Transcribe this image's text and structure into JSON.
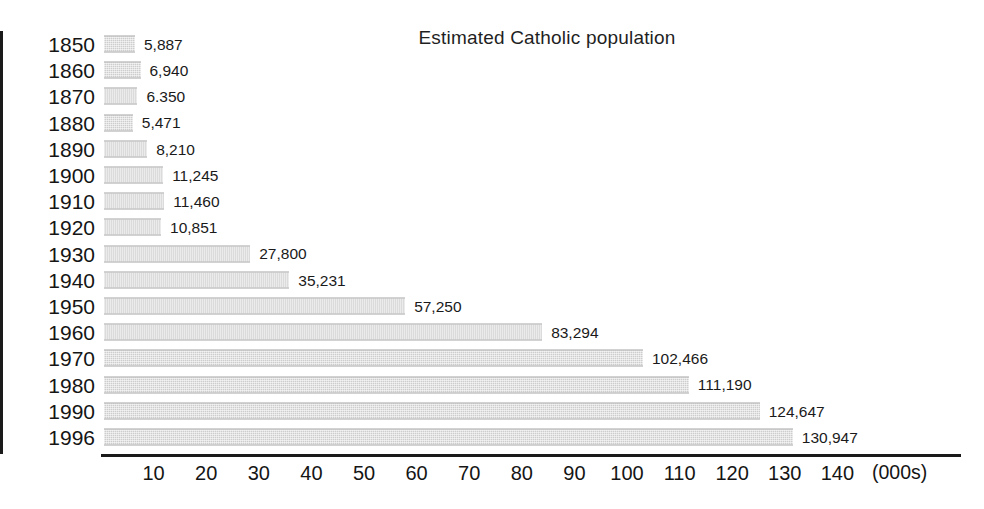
{
  "chart_data": {
    "type": "bar",
    "orientation": "horizontal",
    "title": "Estimated Catholic population",
    "xlabel": "(000s)",
    "ylabel": "",
    "unit_note": "(000s)",
    "xlim": [
      0,
      150
    ],
    "grid": false,
    "legend": null,
    "x_ticks": [
      10,
      20,
      30,
      40,
      50,
      60,
      70,
      80,
      90,
      100,
      110,
      120,
      130,
      140
    ],
    "x_tick_labels": [
      "10",
      "20",
      "30",
      "40",
      "50",
      "60",
      "70",
      "80",
      "90",
      "100",
      "110",
      "120",
      "130",
      "140"
    ],
    "categories": [
      "1850",
      "1860",
      "1870",
      "1880",
      "1890",
      "1900",
      "1910",
      "1920",
      "1930",
      "1940",
      "1950",
      "1960",
      "1970",
      "1980",
      "1990",
      "1996"
    ],
    "values": [
      5887,
      6940,
      6350,
      5471,
      8210,
      11245,
      11460,
      10851,
      27800,
      35231,
      57250,
      83294,
      102466,
      111190,
      124647,
      130947
    ],
    "value_labels": [
      "5,887",
      "6,940",
      "6.350",
      "5,471",
      "8,210",
      "11,245",
      "11,460",
      "10,851",
      "27,800",
      "35,231",
      "57,250",
      "83,294",
      "102,466",
      "111,190",
      "124,647",
      "130,947"
    ],
    "bar_color": "#cdcdcd",
    "axis_color": "#1a1a1a",
    "text_color": "#1a1a1a",
    "rows": [
      {
        "year": "1850",
        "value": 5887,
        "label": "5,887"
      },
      {
        "year": "1860",
        "value": 6940,
        "label": "6,940"
      },
      {
        "year": "1870",
        "value": 6350,
        "label": "6.350"
      },
      {
        "year": "1880",
        "value": 5471,
        "label": "5,471"
      },
      {
        "year": "1890",
        "value": 8210,
        "label": "8,210"
      },
      {
        "year": "1900",
        "value": 11245,
        "label": "11,245"
      },
      {
        "year": "1910",
        "value": 11460,
        "label": "11,460"
      },
      {
        "year": "1920",
        "value": 10851,
        "label": "10,851"
      },
      {
        "year": "1930",
        "value": 27800,
        "label": "27,800"
      },
      {
        "year": "1940",
        "value": 35231,
        "label": "35,231"
      },
      {
        "year": "1950",
        "value": 57250,
        "label": "57,250"
      },
      {
        "year": "1960",
        "value": 83294,
        "label": "83,294"
      },
      {
        "year": "1970",
        "value": 102466,
        "label": "102,466"
      },
      {
        "year": "1980",
        "value": 111190,
        "label": "111,190"
      },
      {
        "year": "1990",
        "value": 124647,
        "label": "124,647"
      },
      {
        "year": "1996",
        "value": 130947,
        "label": "130,947"
      }
    ]
  }
}
